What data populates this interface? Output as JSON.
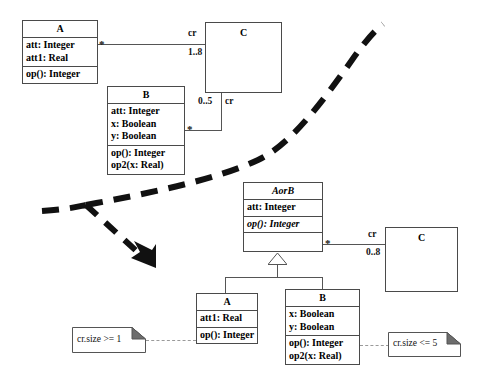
{
  "diagram": {
    "notation": "UML",
    "background_color": "#ffffff",
    "line_color": "#555555",
    "text_color": "#111111"
  },
  "source_model": {
    "classes": [
      {
        "id": "src-a",
        "name": "A",
        "abstract": false,
        "attributes": [
          "att: Integer",
          "att1: Real"
        ],
        "operations": [
          "op(): Integer"
        ]
      },
      {
        "id": "src-b",
        "name": "B",
        "abstract": false,
        "attributes": [
          "att: Integer",
          "x: Boolean",
          "y: Boolean"
        ],
        "operations": [
          "op(): Integer",
          "op2(x: Real)"
        ]
      },
      {
        "id": "src-c",
        "name": "C",
        "abstract": false,
        "attributes": [],
        "operations": []
      }
    ],
    "associations": [
      {
        "id": "assoc-a-c",
        "from": "A",
        "to": "C",
        "source_multiplicity": "*",
        "target_role": "cr",
        "target_multiplicity": "1..8"
      },
      {
        "id": "assoc-b-c",
        "from": "B",
        "to": "C",
        "source_multiplicity": "*",
        "target_role": "cr",
        "target_multiplicity": "0..5"
      }
    ]
  },
  "target_model": {
    "classes": [
      {
        "id": "tgt-aorb",
        "name": "AorB",
        "abstract": true,
        "attributes": [
          "att: Integer"
        ],
        "operations": [
          "op(): Integer"
        ]
      },
      {
        "id": "tgt-a",
        "name": "A",
        "abstract": false,
        "attributes": [
          "att1: Real"
        ],
        "operations": [
          "op(): Integer"
        ]
      },
      {
        "id": "tgt-b",
        "name": "B",
        "abstract": false,
        "attributes": [
          "x: Boolean",
          "y: Boolean"
        ],
        "operations": [
          "op(): Integer",
          "op2(x: Real)"
        ]
      },
      {
        "id": "tgt-c",
        "name": "C",
        "abstract": false,
        "attributes": [],
        "operations": []
      }
    ],
    "generalizations": [
      {
        "id": "gen-a",
        "subclass": "A",
        "superclass": "AorB"
      },
      {
        "id": "gen-b",
        "subclass": "B",
        "superclass": "AorB"
      }
    ],
    "associations": [
      {
        "id": "assoc-aorb-c",
        "from": "AorB",
        "to": "C",
        "source_multiplicity": "*",
        "target_role": "cr",
        "target_multiplicity": "0..8"
      }
    ],
    "notes": [
      {
        "id": "note-left",
        "text": "cr.size >= 1",
        "attached_to": "A"
      },
      {
        "id": "note-right",
        "text": "cr.size <= 5",
        "attached_to": "B"
      }
    ]
  },
  "transformation_arrow": {
    "name": "refactoring-arrow",
    "style": "thick-dashed",
    "color": "#111111",
    "arrowhead": "solid-filled",
    "direction": "downward-right"
  }
}
